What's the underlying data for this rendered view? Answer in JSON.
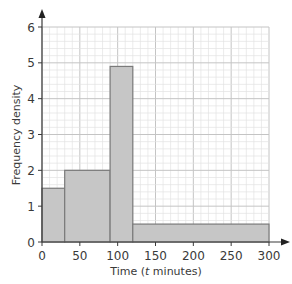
{
  "chart_data": {
    "type": "bar",
    "subtype": "histogram",
    "title": "",
    "xlabel": "Time (t minutes)",
    "xlabel_parts": {
      "pre": "Time (",
      "italic": "t",
      "post": " minutes)"
    },
    "ylabel": "Frequency density",
    "xlim": [
      0,
      300
    ],
    "ylim": [
      0,
      6
    ],
    "x_ticks": [
      0,
      50,
      100,
      150,
      200,
      250,
      300
    ],
    "y_ticks": [
      0,
      1,
      2,
      3,
      4,
      5,
      6
    ],
    "grid": {
      "on": true,
      "minor_x_step": 10,
      "minor_y_step": 0.2,
      "major_x_step": 50,
      "major_y_step": 1
    },
    "bins": [
      {
        "from": 0,
        "to": 30,
        "density": 1.5
      },
      {
        "from": 30,
        "to": 90,
        "density": 2.0
      },
      {
        "from": 90,
        "to": 120,
        "density": 4.9
      },
      {
        "from": 120,
        "to": 300,
        "density": 0.5
      }
    ],
    "colors": {
      "bar_fill": "#c6c6c6",
      "bar_stroke": "#7a7a7a",
      "axis": "#3a3a3a",
      "grid_minor": "#e2e2e2",
      "grid_major": "#c4c4c4"
    }
  }
}
